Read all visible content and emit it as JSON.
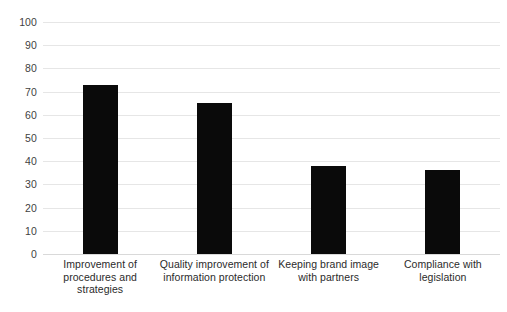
{
  "chart_data": {
    "type": "bar",
    "title": "",
    "subtitle": "",
    "xlabel": "",
    "ylabel": "",
    "ylim": [
      0,
      100
    ],
    "ytick_step": 10,
    "yticks": [
      100,
      90,
      80,
      70,
      60,
      50,
      40,
      30,
      20,
      10,
      0
    ],
    "grid": true,
    "legend": false,
    "legend_position": "none",
    "bar_color": "#0a0a0a",
    "gridline_color": "#e6e6e6",
    "background_color": "#ffffff",
    "categories": [
      "Improvement of procedures and strategies",
      "Quality improvement of information protection",
      "Keeping brand image with partners",
      "Compliance with legislation"
    ],
    "category_lines": [
      [
        "Improvement of",
        "procedures and",
        "strategies"
      ],
      [
        "Quality improvement of",
        "information protection"
      ],
      [
        "Keeping brand image",
        "with partners"
      ],
      [
        "Compliance with",
        "legislation"
      ]
    ],
    "values": [
      73,
      65,
      38,
      36
    ]
  }
}
